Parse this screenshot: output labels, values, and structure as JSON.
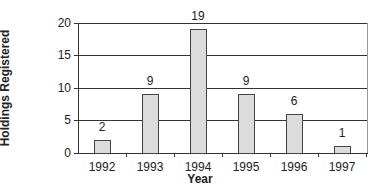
{
  "chart_data": {
    "type": "bar",
    "title": "",
    "xlabel": "Year",
    "ylabel": "Number of Holdings Registered",
    "ylabel_lines": [
      "Number of",
      "Holdings Registered"
    ],
    "categories": [
      "1992",
      "1993",
      "1994",
      "1995",
      "1996",
      "1997"
    ],
    "values": [
      2,
      9,
      19,
      9,
      6,
      1
    ],
    "data_labels": [
      "2",
      "9",
      "19",
      "9",
      "6",
      "1"
    ],
    "ylim": [
      0,
      20
    ],
    "yticks": [
      "0",
      "5",
      "10",
      "15",
      "20"
    ],
    "grid": true,
    "legend": null,
    "bar_color": "#dcdcdc",
    "bar_edge_color": "#444444"
  }
}
